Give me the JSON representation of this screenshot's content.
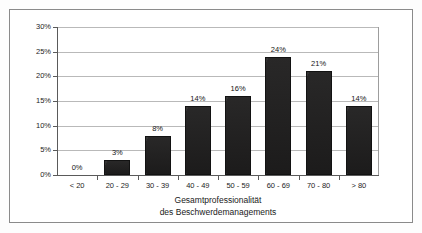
{
  "chart_data": {
    "type": "bar",
    "title": "",
    "subtitle": "",
    "xlabel_line1": "Gesamtprofessionalität",
    "xlabel_line2": "des Beschwerdemanagements",
    "ylabel": "",
    "categories": [
      "< 20",
      "20 - 29",
      "30 - 39",
      "40 - 49",
      "50 - 59",
      "60 - 69",
      "70 - 80",
      "> 80"
    ],
    "values": [
      0,
      3,
      8,
      14,
      16,
      24,
      21,
      14
    ],
    "value_labels": [
      "0%",
      "3%",
      "8%",
      "14%",
      "16%",
      "24%",
      "21%",
      "14%"
    ],
    "ylim": [
      0,
      30
    ],
    "ytick_values": [
      0,
      5,
      10,
      15,
      20,
      25,
      30
    ],
    "ytick_labels": [
      "0%",
      "5%",
      "10%",
      "15%",
      "20%",
      "25%",
      "30%"
    ],
    "grid": "horizontal",
    "legend": "none",
    "bar_color": "#201f1f",
    "gridline_color": "#b9b9b9",
    "axis_color": "#5a5a5a",
    "frame_color": "#8a8a8a",
    "background_color": "#ffffff"
  }
}
